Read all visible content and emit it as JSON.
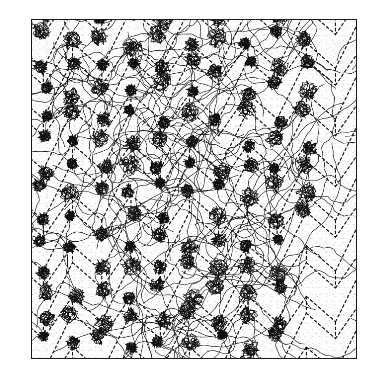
{
  "figure": {
    "kind": "simulation-snapshot",
    "title": "",
    "caption": "",
    "background_color": "#ffffff",
    "ink_color": "#111111",
    "frame": {
      "x": 31,
      "y": 19,
      "width": 326,
      "height": 340,
      "border_color": "#1a1a1a",
      "border_width": 1.4,
      "fill_color": "#fdfdfd"
    }
  },
  "chart_data": {
    "type": "scatter",
    "title": "",
    "xlabel": "",
    "ylabel": "",
    "xlim": [
      0,
      326
    ],
    "ylim": [
      0,
      340
    ],
    "grid": false,
    "legend_position": "none",
    "lattice": {
      "name": "honeycomb-dashed-lattice",
      "type": "honeycomb",
      "bond_length": 17.0,
      "cell_width": 29.4,
      "cell_height": 51.0,
      "line_color": "#141414",
      "line_width": 1.15,
      "dash_pattern": [
        2.6,
        2.8
      ],
      "origin_x": -18,
      "origin_y": -28,
      "columns": 14,
      "rows": 10
    },
    "coils": {
      "name": "polymer-coil-cluster",
      "count": 132,
      "color": "#0d0d0d",
      "line_width": 0.62,
      "segments_per_coil": 150,
      "step_length": 2.45,
      "radius_mean": 9.2,
      "radius_jitter": 3.4,
      "vertex_jitter": 4.2,
      "density_label": "dense"
    },
    "tethers": {
      "name": "connecting-chain",
      "count": 150,
      "color": "#151515",
      "line_width": 0.58,
      "segments_per_chain": 26,
      "step_length": 5.4,
      "wander": 0.72
    },
    "series": [
      {
        "name": "lattice-bonds",
        "values": []
      },
      {
        "name": "coil-clusters",
        "values": []
      },
      {
        "name": "connecting-chains",
        "values": []
      }
    ],
    "random_seed": 20240917
  }
}
